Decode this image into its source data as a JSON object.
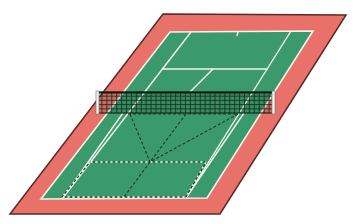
{
  "diagram": {
    "subject": "tennis court in oblique projection with net and dashed region lines",
    "colors": {
      "background": "#ffffff",
      "surround": "#e8716a",
      "court": "#3a9a6c",
      "lines": "#f4f4ec",
      "outline": "#5a2a28",
      "net": "#1b2a1c",
      "post": "#f2f2f2",
      "dashed": "#1c3b26"
    },
    "surround_polygon": [
      [
        163,
        14
      ],
      [
        346,
        15
      ],
      [
        220,
        214
      ],
      [
        10,
        214
      ]
    ],
    "court_polygon": [
      [
        170,
        32
      ],
      [
        313,
        31
      ],
      [
        207,
        198
      ],
      [
        41,
        199
      ]
    ],
    "court_lines": {
      "singles_left": [
        [
          191,
          32
        ],
        [
          62,
          199
        ]
      ],
      "singles_right": [
        [
          291,
          31
        ],
        [
          186,
          198
        ]
      ],
      "service_line_far": [
        [
          162,
          69
        ],
        [
          268,
          69
        ]
      ],
      "center_line_far": [
        [
          213,
          69
        ],
        [
          190,
          92
        ]
      ],
      "center_mark_far": [
        [
          238,
          32
        ],
        [
          237,
          36
        ]
      ],
      "singles_left_near": [
        [
          123,
          113
        ],
        [
          62,
          199
        ]
      ],
      "singles_right_near": [
        [
          244,
          113
        ],
        [
          186,
          198
        ]
      ]
    },
    "net": {
      "x": 97,
      "y": 92,
      "width": 177,
      "height": 21,
      "cols": 36,
      "rows": 5,
      "left_post": "left-net-post",
      "right_post": "right-net-post"
    },
    "dashed_lines": {
      "near_service_line": [
        [
          90,
          162
        ],
        [
          206,
          162
        ]
      ],
      "near_baseline": [
        [
          62,
          197
        ],
        [
          186,
          197
        ]
      ],
      "left_box_edge": [
        [
          90,
          162
        ],
        [
          62,
          197
        ]
      ],
      "right_box_edge": [
        [
          206,
          162
        ],
        [
          186,
          197
        ]
      ],
      "center_divider": [
        [
          150,
          162
        ],
        [
          124,
          197
        ]
      ],
      "net_band_bottom": [
        [
          128,
          114
        ],
        [
          236,
          114
        ]
      ],
      "diagonal_left": [
        [
          130,
          114
        ],
        [
          150,
          162
        ]
      ],
      "diagonal_center": [
        [
          186,
          114
        ],
        [
          150,
          162
        ]
      ],
      "diagonal_right": [
        [
          238,
          114
        ],
        [
          150,
          162
        ]
      ]
    },
    "convergence_point": [
      150,
      162
    ]
  }
}
